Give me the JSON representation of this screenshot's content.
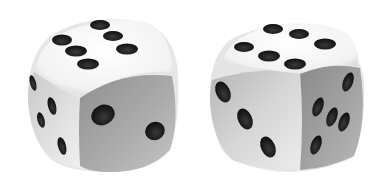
{
  "scene": {
    "description": "Two white six-sided dice on a white background",
    "background": "#ffffff",
    "dice": [
      {
        "id": "left",
        "top_face_pips": 6,
        "right_face_pips": 2,
        "left_face_pips": 4,
        "colors": {
          "body_light": "#f4f4f4",
          "body_shadow": "#9a9a9a",
          "pip": "#1a1a1a"
        }
      },
      {
        "id": "right",
        "top_face_pips": 6,
        "left_face_pips": 3,
        "right_face_pips": 5,
        "colors": {
          "body_light": "#f4f4f4",
          "body_shadow": "#8e8e8e",
          "pip": "#1a1a1a"
        }
      }
    ]
  }
}
